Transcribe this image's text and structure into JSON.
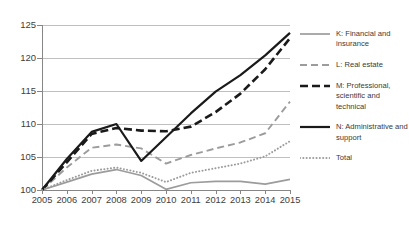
{
  "chart_data": {
    "type": "line",
    "title": "",
    "xlabel": "",
    "ylabel": "",
    "x": [
      2005,
      2006,
      2007,
      2008,
      2009,
      2010,
      2011,
      2012,
      2013,
      2014,
      2015
    ],
    "xlim": [
      2005,
      2015
    ],
    "ylim": [
      100,
      125
    ],
    "yticks": [
      100,
      105,
      110,
      115,
      120,
      125
    ],
    "xticks": [
      "2005",
      "2006",
      "2007",
      "2008",
      "2009",
      "2010",
      "2011",
      "2012",
      "2013",
      "2014",
      "2015"
    ],
    "grid": true,
    "legend_position": "right",
    "series": [
      {
        "name": "K: Financial and insurance",
        "key": "K",
        "style": "solid",
        "color": "#9c9c9c",
        "width": 1.7,
        "values": [
          100,
          101.2,
          102.4,
          103.1,
          102.2,
          100.1,
          101.1,
          101.3,
          101.3,
          100.9,
          101.6
        ]
      },
      {
        "name": "L: Real estate",
        "key": "L",
        "style": "dashed",
        "color": "#9c9c9c",
        "width": 1.9,
        "values": [
          100,
          103.4,
          106.4,
          106.9,
          106.3,
          104.0,
          105.3,
          106.3,
          107.2,
          108.6,
          113.4
        ]
      },
      {
        "name": "M: Professional, scientific and technical",
        "key": "M",
        "style": "dashed-bold",
        "color": "#1a1a1a",
        "width": 2.6,
        "values": [
          100,
          104.2,
          108.5,
          109.4,
          109.0,
          108.9,
          109.6,
          111.8,
          114.6,
          118.3,
          123.0
        ]
      },
      {
        "name": "N: Administrative and support",
        "key": "N",
        "style": "solid-bold",
        "color": "#1a1a1a",
        "width": 2.2,
        "values": [
          100,
          104.7,
          108.8,
          110.0,
          104.4,
          108.0,
          111.6,
          114.9,
          117.4,
          120.4,
          123.8
        ]
      },
      {
        "name": "Total",
        "key": "Total",
        "style": "dotted",
        "color": "#9c9c9c",
        "width": 2.0,
        "values": [
          100,
          101.5,
          102.9,
          103.4,
          102.6,
          101.2,
          102.6,
          103.3,
          104.0,
          105.1,
          107.4
        ]
      }
    ]
  },
  "legend": {
    "items": [
      {
        "label": "K: Financial and insurance",
        "marker": "line-solid-thin-gray"
      },
      {
        "label": "L: Real estate",
        "marker": "line-dashed-gray"
      },
      {
        "label": "M: Professional, scientific and technical",
        "marker": "line-dashed-bold-black"
      },
      {
        "label": "N: Administrative and support",
        "marker": "line-solid-bold-black"
      },
      {
        "label": "Total",
        "marker": "line-dotted-gray"
      }
    ]
  }
}
